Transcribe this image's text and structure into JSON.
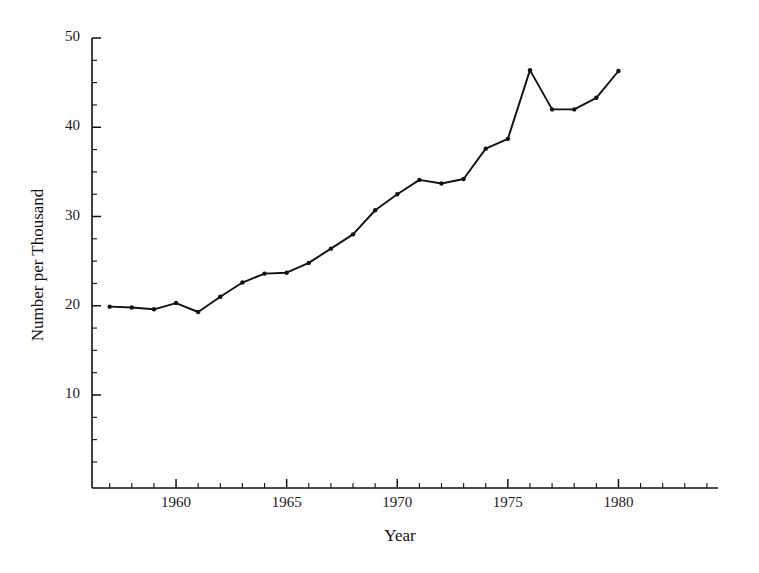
{
  "chart_data": {
    "type": "line",
    "title": "",
    "subtitle": "",
    "xlabel": "Year",
    "ylabel": "Number per Thousand",
    "xlim": [
      1956.2,
      1984.5
    ],
    "ylim": [
      0,
      52
    ],
    "grid": false,
    "legend": null,
    "x_tick_labels": [
      "1960",
      "1965",
      "1970",
      "1975",
      "1980"
    ],
    "x_tick_values": [
      1960,
      1965,
      1970,
      1975,
      1980
    ],
    "x_minor_tick_step": 1,
    "y_tick_labels": [
      "10",
      "20",
      "30",
      "40",
      "50"
    ],
    "y_tick_values": [
      10,
      20,
      30,
      40,
      50
    ],
    "y_minor_tick_step": 2.5,
    "marker": "dot",
    "line_color": "#111111",
    "series": [
      {
        "name": "Number per Thousand",
        "x": [
          1957,
          1958,
          1959,
          1960,
          1961,
          1962,
          1963,
          1964,
          1965,
          1966,
          1967,
          1968,
          1969,
          1970,
          1971,
          1972,
          1973,
          1974,
          1975,
          1976,
          1977,
          1978,
          1979,
          1980
        ],
        "values": [
          19.9,
          19.8,
          19.6,
          20.3,
          19.3,
          21.0,
          22.6,
          23.6,
          23.7,
          24.8,
          26.4,
          28.0,
          30.7,
          32.5,
          34.1,
          33.7,
          34.2,
          37.6,
          38.7,
          46.4,
          42.0,
          42.0,
          43.3,
          46.3
        ]
      }
    ]
  },
  "axes": {
    "y_title": "Number per Thousand",
    "x_title": "Year"
  }
}
